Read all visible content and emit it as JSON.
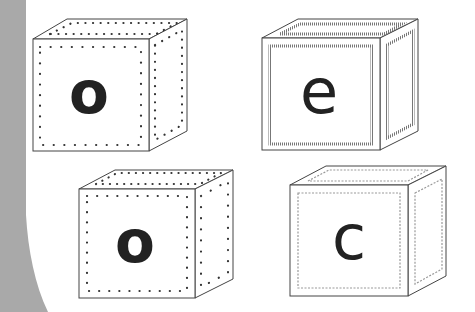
{
  "page": {
    "background": "#ffffff",
    "side_band_color": "#a9a9a9"
  },
  "blocks": [
    {
      "letter": "o",
      "border_style": "dotted",
      "position": "top-left"
    },
    {
      "letter": "e",
      "border_style": "hatched",
      "position": "top-right"
    },
    {
      "letter": "o",
      "border_style": "dotted",
      "position": "bottom-left"
    },
    {
      "letter": "c",
      "border_style": "wavy",
      "position": "bottom-right"
    }
  ],
  "colors": {
    "outline": "#444444",
    "letter": "#222222",
    "dots": "#333333",
    "hatch": "#777777",
    "wavy": "#999999"
  }
}
